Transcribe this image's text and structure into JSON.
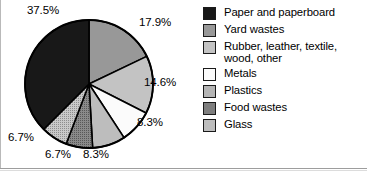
{
  "chart_data": {
    "type": "pie",
    "title": "",
    "subtitle": "",
    "xlabel": "",
    "ylabel": "",
    "legend_position": "right",
    "grid": false,
    "units": "percent",
    "start_angle_deg": 0,
    "direction": "clockwise",
    "categories": [
      "Yard wastes",
      "Rubber, leather, textile, wood, other",
      "Metals",
      "Glass",
      "Food wastes",
      "Plastics",
      "Paper and paperboard"
    ],
    "values": [
      17.9,
      14.6,
      8.3,
      8.3,
      6.7,
      6.7,
      37.5
    ],
    "slices": [
      {
        "label": "Yard wastes",
        "value": 17.9,
        "value_text": "17.9%",
        "color": "#989898"
      },
      {
        "label": "Rubber, leather, textile, wood, other",
        "value": 14.6,
        "value_text": "14.6%",
        "color": "#c3c3c3"
      },
      {
        "label": "Metals",
        "value": 8.3,
        "value_text": "8.3%",
        "color": "#fbfbfb"
      },
      {
        "label": "Glass",
        "value": 8.3,
        "value_text": "8.3%",
        "color": "#bdbdbd"
      },
      {
        "label": "Food wastes",
        "value": 6.7,
        "value_text": "6.7%",
        "color": "#7e7e7e"
      },
      {
        "label": "Plastics",
        "value": 6.7,
        "value_text": "6.7%",
        "color": "#b5b5b5"
      },
      {
        "label": "Paper and paperboard",
        "value": 37.5,
        "value_text": "37.5%",
        "color": "#181818"
      }
    ]
  },
  "pie_labels": [
    {
      "text": "37.5%"
    },
    {
      "text": "17.9%"
    },
    {
      "text": "14.6%"
    },
    {
      "text": "8.3%"
    },
    {
      "text": "8.3%"
    },
    {
      "text": "6.7%"
    },
    {
      "text": "6.7%"
    }
  ],
  "legend": {
    "items": [
      {
        "label": "Paper and paperboard",
        "label_line2": "",
        "color": "#181818"
      },
      {
        "label": "Yard wastes",
        "label_line2": "",
        "color": "#989898"
      },
      {
        "label": "Rubber, leather, textile,",
        "label_line2": "wood, other",
        "color": "#c3c3c3"
      },
      {
        "label": "Metals",
        "label_line2": "",
        "color": "#fbfbfb"
      },
      {
        "label": "Plastics",
        "label_line2": "",
        "color": "#b5b5b5"
      },
      {
        "label": "Food wastes",
        "label_line2": "",
        "color": "#7e7e7e"
      },
      {
        "label": "Glass",
        "label_line2": "",
        "color": "#bdbdbd"
      }
    ]
  },
  "colors": {
    "outline": "#000000",
    "background": "#ffffff",
    "text": "#000000",
    "border_rule": "#9d9d9d"
  }
}
